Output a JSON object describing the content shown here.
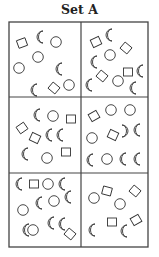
{
  "title": "Set A",
  "grid": {
    "rows": 3,
    "cols": 2,
    "x0": 9,
    "y0": 22,
    "x1": 148,
    "y1": 247,
    "xm": 81,
    "ym1": 97,
    "ym2": 173
  },
  "colors": {
    "stroke": "#333333",
    "frame": "#444444",
    "background": "#ffffff"
  },
  "panels": [
    {
      "id": "panel-1-1",
      "shapes": [
        {
          "type": "square",
          "x": 22,
          "y": 43,
          "r": -20
        },
        {
          "type": "crescent",
          "x": 41,
          "y": 37
        },
        {
          "type": "circle",
          "x": 56,
          "y": 42
        },
        {
          "type": "circle",
          "x": 38,
          "y": 57
        },
        {
          "type": "circle",
          "x": 19,
          "y": 68
        },
        {
          "type": "crescent",
          "x": 60,
          "y": 69
        },
        {
          "type": "crescent",
          "x": 35,
          "y": 90
        },
        {
          "type": "square",
          "x": 54,
          "y": 88,
          "r": 40
        },
        {
          "type": "circle",
          "x": 69,
          "y": 85
        }
      ]
    },
    {
      "id": "panel-2-1",
      "shapes": [
        {
          "type": "square",
          "x": 96,
          "y": 42,
          "r": -25
        },
        {
          "type": "crescent",
          "x": 110,
          "y": 35
        },
        {
          "type": "square",
          "x": 126,
          "y": 48,
          "r": 40
        },
        {
          "type": "crescent",
          "x": 95,
          "y": 62
        },
        {
          "type": "circle",
          "x": 110,
          "y": 55
        },
        {
          "type": "square",
          "x": 102,
          "y": 76,
          "r": 40
        },
        {
          "type": "square",
          "x": 128,
          "y": 72,
          "r": 0
        },
        {
          "type": "crescent",
          "x": 141,
          "y": 71
        },
        {
          "type": "crescent",
          "x": 90,
          "y": 85
        },
        {
          "type": "circle",
          "x": 118,
          "y": 81
        },
        {
          "type": "crescent",
          "x": 134,
          "y": 88
        }
      ]
    },
    {
      "id": "panel-1-2",
      "shapes": [
        {
          "type": "crescent",
          "x": 38,
          "y": 115
        },
        {
          "type": "circle",
          "x": 53,
          "y": 116
        },
        {
          "type": "square",
          "x": 71,
          "y": 119,
          "r": 0
        },
        {
          "type": "square",
          "x": 22,
          "y": 128,
          "r": -35
        },
        {
          "type": "crescent",
          "x": 50,
          "y": 135
        },
        {
          "type": "crescent",
          "x": 61,
          "y": 135
        },
        {
          "type": "square",
          "x": 35,
          "y": 138,
          "r": 25
        },
        {
          "type": "crescent",
          "x": 26,
          "y": 154
        },
        {
          "type": "circle",
          "x": 47,
          "y": 158
        },
        {
          "type": "square",
          "x": 66,
          "y": 152,
          "r": 0
        }
      ]
    },
    {
      "id": "panel-2-2",
      "shapes": [
        {
          "type": "square",
          "x": 94,
          "y": 116,
          "r": -30
        },
        {
          "type": "circle",
          "x": 111,
          "y": 110
        },
        {
          "type": "circle",
          "x": 130,
          "y": 110
        },
        {
          "type": "circle",
          "x": 92,
          "y": 138
        },
        {
          "type": "square",
          "x": 113,
          "y": 135,
          "r": 25
        },
        {
          "type": "crescent",
          "x": 124,
          "y": 131,
          "flip": true
        },
        {
          "type": "crescent",
          "x": 138,
          "y": 130
        },
        {
          "type": "crescent",
          "x": 91,
          "y": 160
        },
        {
          "type": "circle",
          "x": 107,
          "y": 159
        },
        {
          "type": "crescent",
          "x": 124,
          "y": 159
        },
        {
          "type": "crescent",
          "x": 138,
          "y": 159
        }
      ]
    },
    {
      "id": "panel-1-3",
      "shapes": [
        {
          "type": "crescent",
          "x": 20,
          "y": 184
        },
        {
          "type": "square",
          "x": 34,
          "y": 184,
          "r": 0
        },
        {
          "type": "circle",
          "x": 48,
          "y": 184
        },
        {
          "type": "crescent",
          "x": 63,
          "y": 184
        },
        {
          "type": "crescent",
          "x": 69,
          "y": 197
        },
        {
          "type": "circle",
          "x": 23,
          "y": 210
        },
        {
          "type": "crescent",
          "x": 40,
          "y": 203
        },
        {
          "type": "circle",
          "x": 54,
          "y": 201
        },
        {
          "type": "crescent",
          "x": 27,
          "y": 230
        },
        {
          "type": "circle",
          "x": 33,
          "y": 230
        },
        {
          "type": "crescent",
          "x": 52,
          "y": 223
        },
        {
          "type": "crescent",
          "x": 63,
          "y": 224
        },
        {
          "type": "square",
          "x": 70,
          "y": 234,
          "r": 40
        }
      ]
    },
    {
      "id": "panel-2-3",
      "shapes": [
        {
          "type": "circle",
          "x": 94,
          "y": 198
        },
        {
          "type": "square",
          "x": 107,
          "y": 191,
          "r": 15
        },
        {
          "type": "square",
          "x": 135,
          "y": 191,
          "r": 40
        },
        {
          "type": "circle",
          "x": 120,
          "y": 204
        },
        {
          "type": "crescent",
          "x": 93,
          "y": 230
        },
        {
          "type": "square",
          "x": 112,
          "y": 222,
          "r": 0
        },
        {
          "type": "crescent",
          "x": 125,
          "y": 231
        },
        {
          "type": "square",
          "x": 136,
          "y": 220,
          "r": -30
        }
      ]
    }
  ]
}
